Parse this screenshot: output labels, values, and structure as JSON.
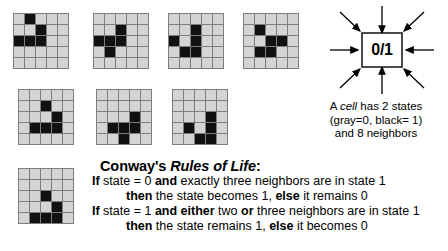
{
  "grids": {
    "rows": 5,
    "cols": 5,
    "off_color": "#d4d4d4",
    "on_color": "#111111",
    "line_color": "#7d7d7d",
    "items": [
      {
        "name": "grid-1",
        "live_cells": [
          [
            0,
            1
          ],
          [
            1,
            2
          ],
          [
            2,
            0
          ],
          [
            2,
            1
          ],
          [
            2,
            2
          ]
        ]
      },
      {
        "name": "grid-2",
        "live_cells": [
          [
            1,
            2
          ],
          [
            2,
            0
          ],
          [
            2,
            1
          ],
          [
            2,
            2
          ],
          [
            3,
            1
          ]
        ]
      },
      {
        "name": "grid-3",
        "live_cells": [
          [
            1,
            2
          ],
          [
            2,
            0
          ],
          [
            2,
            2
          ],
          [
            3,
            1
          ],
          [
            3,
            2
          ]
        ]
      },
      {
        "name": "grid-4",
        "live_cells": [
          [
            1,
            1
          ],
          [
            2,
            2
          ],
          [
            2,
            3
          ],
          [
            3,
            1
          ],
          [
            3,
            2
          ]
        ]
      },
      {
        "name": "grid-5",
        "live_cells": [
          [
            1,
            2
          ],
          [
            2,
            3
          ],
          [
            3,
            1
          ],
          [
            3,
            2
          ],
          [
            3,
            3
          ]
        ]
      },
      {
        "name": "grid-6",
        "live_cells": [
          [
            2,
            3
          ],
          [
            3,
            1
          ],
          [
            3,
            2
          ],
          [
            3,
            3
          ],
          [
            4,
            2
          ]
        ]
      },
      {
        "name": "grid-7",
        "live_cells": [
          [
            2,
            3
          ],
          [
            3,
            1
          ],
          [
            3,
            3
          ],
          [
            4,
            2
          ],
          [
            4,
            3
          ]
        ]
      },
      {
        "name": "grid-8",
        "live_cells": [
          [
            2,
            2
          ],
          [
            3,
            3
          ],
          [
            4,
            1
          ],
          [
            4,
            2
          ],
          [
            4,
            3
          ]
        ]
      }
    ]
  },
  "cell_diagram": {
    "box_label": "0/1",
    "neighbor_arrow_count": 8,
    "stroke_color": "#000000"
  },
  "cell_caption": {
    "line1_pre": "A ",
    "line1_italic": "cell",
    "line1_post": " has 2 states",
    "line2": "(gray=0, black= 1)",
    "line3": "and 8 neighbors"
  },
  "rules": {
    "title_pre": "Conway's ",
    "title_italic": "Rules of Life",
    "title_post": ":",
    "rule1_if": {
      "b1": "If",
      "t1": " state = 0 ",
      "b2": "and",
      "t2": " exactly three neighbors are in state 1"
    },
    "rule1_then": {
      "b1": "then",
      "t1": " the state becomes 1, ",
      "b2": "else",
      "t2": " it remains 0"
    },
    "rule2_if": {
      "b1": "If",
      "t1": " state = 1 ",
      "b2": "and either",
      "t2": " two ",
      "b3": "or",
      "t3": " three neighbors are in state 1"
    },
    "rule2_then": {
      "b1": "then",
      "t1": " the state remains 1, ",
      "b2": "else",
      "t2": " it becomes 0"
    }
  }
}
